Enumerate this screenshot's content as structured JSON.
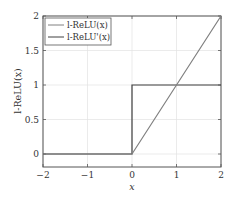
{
  "chart_data": {
    "type": "line",
    "title": "",
    "xlabel": "x",
    "ylabel": "l-ReLU(x)",
    "xlim": [
      -2,
      2
    ],
    "ylim": [
      -0.18,
      2
    ],
    "grid": true,
    "legend_position": "upper left",
    "x_ticks": [
      "−2",
      "−1",
      "0",
      "1",
      "2"
    ],
    "y_ticks": [
      "0",
      "0.5",
      "1",
      "1.5",
      "2"
    ],
    "series": [
      {
        "name": "l-ReLU(x)",
        "color": "#808080",
        "x": [
          -2,
          0,
          2
        ],
        "y": [
          0,
          0,
          2
        ]
      },
      {
        "name": "l-ReLU'(x)",
        "color": "#404040",
        "x": [
          -2,
          0,
          0,
          2
        ],
        "y": [
          0,
          0,
          1,
          1
        ]
      }
    ]
  },
  "legend": {
    "items": [
      {
        "label": "l-ReLU(x)",
        "color": "#808080"
      },
      {
        "label": "l-ReLU'(x)",
        "color": "#404040"
      }
    ]
  },
  "axes": {
    "xlabel": "x",
    "ylabel": "l-ReLU(x)",
    "x_ticks": [
      {
        "v": -2,
        "label": "−2"
      },
      {
        "v": -1,
        "label": "−1"
      },
      {
        "v": 0,
        "label": "0"
      },
      {
        "v": 1,
        "label": "1"
      },
      {
        "v": 2,
        "label": "2"
      }
    ],
    "y_ticks": [
      {
        "v": 0,
        "label": "0"
      },
      {
        "v": 0.5,
        "label": "0.5"
      },
      {
        "v": 1,
        "label": "1"
      },
      {
        "v": 1.5,
        "label": "1.5"
      },
      {
        "v": 2,
        "label": "2"
      }
    ]
  }
}
